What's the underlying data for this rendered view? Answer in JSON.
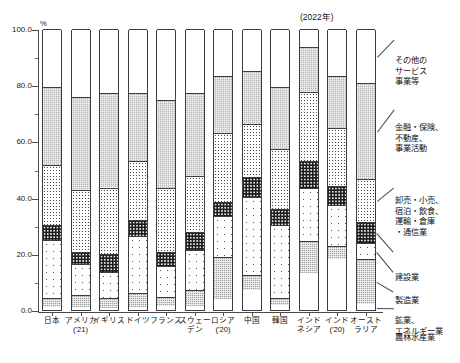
{
  "unit_label": "%",
  "year_note": "(2022年)",
  "axis": {
    "y_ticks": [
      "100.0",
      "80.0",
      "60.0",
      "40.0",
      "20.0",
      "0.0"
    ],
    "y_min": 0,
    "y_max": 100
  },
  "legend": {
    "items": [
      {
        "key": "other",
        "lines": [
          "その他の",
          "サービス",
          "事業等"
        ]
      },
      {
        "key": "finance",
        "lines": [
          "金融・保険、",
          "不動産、",
          "事業活動"
        ]
      },
      {
        "key": "trade",
        "lines": [
          "卸売・小売、",
          "宿泊・飲食、",
          "運輸・倉庫",
          "・通信業"
        ]
      },
      {
        "key": "construction",
        "lines": [
          "建設業"
        ]
      },
      {
        "key": "manufacturing",
        "lines": [
          "製造業"
        ]
      },
      {
        "key": "mining",
        "lines": [
          "鉱業、",
          "エネルギー業"
        ]
      },
      {
        "key": "agriculture",
        "lines": [
          "農林水産業"
        ]
      }
    ]
  },
  "chart_data": {
    "type": "bar",
    "stacked": true,
    "title": "",
    "xlabel": "",
    "ylabel": "%",
    "ylim": [
      0,
      100
    ],
    "grid": false,
    "legend_position": "right",
    "categories": [
      "日本",
      "アメリカ('21)",
      "イギリス",
      "ドイツ",
      "フランス",
      "スウェーデン",
      "ロシア('20)",
      "中国",
      "韓国",
      "インドネシア",
      "インド('20)",
      "オーストラリア"
    ],
    "category_lines": [
      [
        "日本"
      ],
      [
        "アメリカ",
        "('21)"
      ],
      [
        "イギリス"
      ],
      [
        "ドイツ"
      ],
      [
        "フランス"
      ],
      [
        "スウェー",
        "デン"
      ],
      [
        "ロシア",
        "('20)"
      ],
      [
        "中国"
      ],
      [
        "韓国"
      ],
      [
        "インド",
        "ネシア"
      ],
      [
        "インド",
        "('20)"
      ],
      [
        "オースト",
        "ラリア"
      ]
    ],
    "series": [
      {
        "name": "農林水産業",
        "key": "agriculture",
        "values": [
          1.0,
          0.9,
          0.7,
          0.9,
          1.6,
          1.3,
          3.8,
          7.3,
          1.8,
          13.0,
          18.3,
          2.3
        ]
      },
      {
        "name": "鉱業、エネルギー業",
        "key": "mining",
        "values": [
          3.4,
          4.3,
          3.6,
          5.3,
          3.2,
          5.9,
          15.0,
          5.3,
          2.6,
          11.4,
          4.6,
          15.8
        ]
      },
      {
        "name": "製造業",
        "key": "manufacturing",
        "values": [
          20.4,
          11.1,
          9.2,
          20.3,
          10.8,
          14.1,
          14.5,
          27.7,
          25.9,
          19.1,
          14.3,
          5.9
        ]
      },
      {
        "name": "建設業",
        "key": "construction",
        "values": [
          5.6,
          4.3,
          6.4,
          5.6,
          5.0,
          6.4,
          5.0,
          6.9,
          5.6,
          9.4,
          7.0,
          7.3
        ]
      },
      {
        "name": "卸売・小売、宿泊・飲食、運輸・倉庫・通信業",
        "key": "trade",
        "values": [
          21.1,
          22.2,
          23.7,
          21.0,
          22.9,
          20.0,
          24.8,
          19.0,
          21.3,
          24.6,
          20.6,
          15.4
        ]
      },
      {
        "name": "金融・保険、不動産、事業活動",
        "key": "finance",
        "values": [
          27.9,
          33.0,
          33.7,
          24.2,
          31.4,
          29.6,
          20.2,
          18.8,
          22.0,
          16.1,
          18.5,
          34.0
        ]
      },
      {
        "name": "その他のサービス事業等",
        "key": "other",
        "values": [
          20.6,
          24.2,
          22.7,
          22.7,
          25.1,
          22.7,
          16.7,
          15.0,
          20.8,
          6.4,
          16.7,
          19.3
        ]
      }
    ]
  }
}
